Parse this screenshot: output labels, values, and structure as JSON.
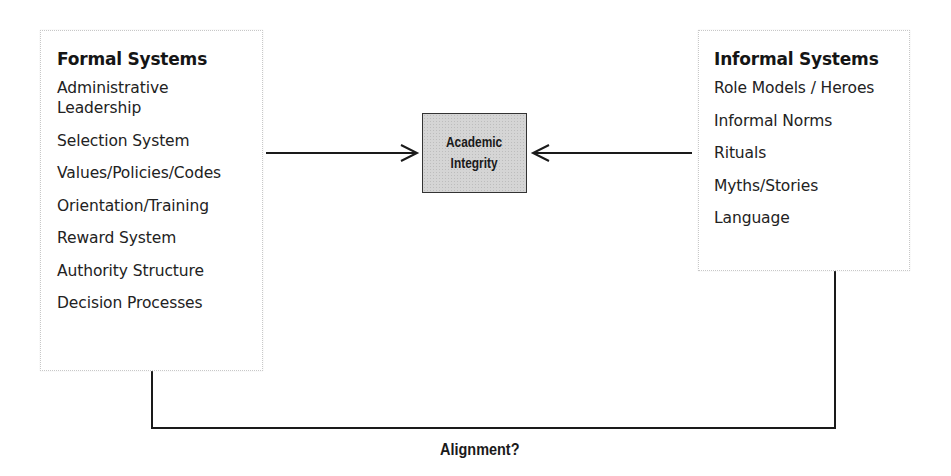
{
  "diagram": {
    "formal_systems": {
      "title": "Formal Systems",
      "items": [
        "Administrative\nLeadership",
        "Selection System",
        "Values/Policies/Codes",
        "Orientation/Training",
        "Reward System",
        "Authority Structure",
        "Decision Processes"
      ]
    },
    "center": {
      "label": "Academic\nIntegrity",
      "fill_color": "#d5d5d5"
    },
    "informal_systems": {
      "title": "Informal Systems",
      "items": [
        "Role Models / Heroes",
        "Informal Norms",
        "Rituals",
        "Myths/Stories",
        "Language"
      ]
    },
    "connector_label": "Alignment?",
    "edges": [
      {
        "from": "Formal Systems",
        "to": "Academic Integrity",
        "type": "arrow"
      },
      {
        "from": "Informal Systems",
        "to": "Academic Integrity",
        "type": "arrow"
      },
      {
        "from": "Formal Systems",
        "to": "Informal Systems",
        "type": "connector",
        "label": "Alignment?"
      }
    ]
  }
}
